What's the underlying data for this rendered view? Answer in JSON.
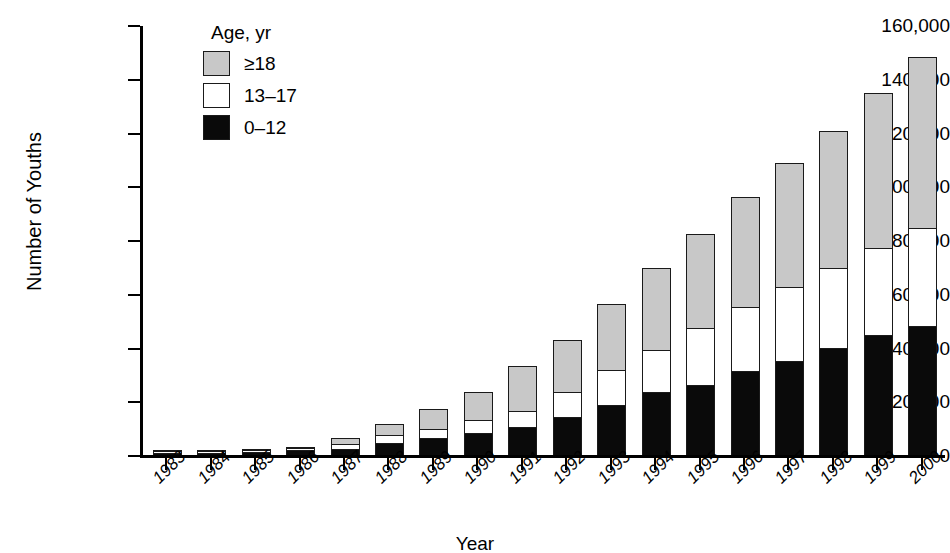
{
  "chart_data": {
    "type": "bar",
    "stacked": true,
    "title": "",
    "xlabel": "Year",
    "ylabel": "Number of Youths",
    "ylim": [
      0,
      160000
    ],
    "yticks": [
      0,
      20000,
      40000,
      60000,
      80000,
      100000,
      120000,
      140000,
      160000
    ],
    "ytick_labels": [
      "0",
      "20,000",
      "40,000",
      "60,000",
      "80,000",
      "100,000",
      "120,000",
      "140,000",
      "160,000"
    ],
    "grid": false,
    "legend_title": "Age, yr",
    "legend_position": "upper-left-inside",
    "categories": [
      "1983",
      "1984",
      "1985",
      "1986",
      "1987",
      "1988",
      "1989",
      "1990",
      "1991",
      "1992",
      "1993",
      "1994",
      "1995",
      "1996",
      "1997",
      "1998",
      "1999",
      "2000"
    ],
    "series": [
      {
        "name": "0–12",
        "color": "#0a0a0a",
        "values": [
          400,
          600,
          1200,
          1800,
          2400,
          4500,
          6200,
          8200,
          10500,
          14000,
          18500,
          23500,
          26200,
          31200,
          35000,
          40000,
          44500,
          48000
        ]
      },
      {
        "name": "13–17",
        "color": "#ffffff",
        "values": [
          200,
          300,
          500,
          700,
          1800,
          3000,
          3300,
          4800,
          6000,
          9500,
          13000,
          15500,
          21000,
          24000,
          27500,
          29500,
          32500,
          36500
        ]
      },
      {
        "name": "≥18",
        "color": "#c8c8c8",
        "values": [
          200,
          300,
          500,
          800,
          2600,
          4500,
          8000,
          11000,
          17000,
          19500,
          25000,
          31000,
          35500,
          41000,
          46500,
          51500,
          58000,
          64000
        ]
      }
    ],
    "totals": [
      800,
      1200,
      2200,
      3300,
      6800,
      12000,
      17500,
      24000,
      33500,
      43000,
      56500,
      70000,
      82700,
      96200,
      109000,
      121000,
      135000,
      148500
    ]
  },
  "axes": {
    "y_title": "Number of Youths",
    "x_title": "Year"
  },
  "legend": {
    "title": "Age, yr",
    "items": [
      {
        "label": "≥18",
        "swatch": "gray-swatch",
        "color": "#c8c8c8"
      },
      {
        "label": "13–17",
        "swatch": "white-swatch",
        "color": "#ffffff"
      },
      {
        "label": "0–12",
        "swatch": "black-swatch",
        "color": "#0a0a0a"
      }
    ]
  }
}
